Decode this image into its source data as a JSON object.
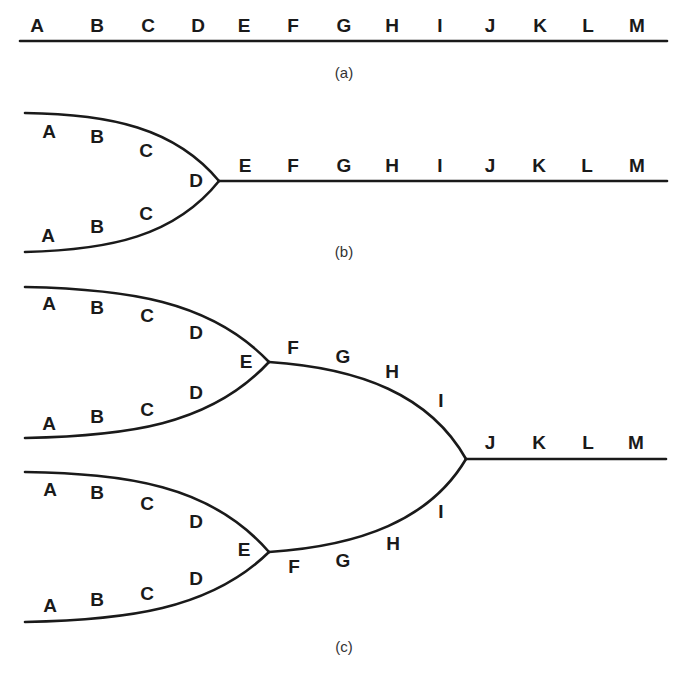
{
  "figure": {
    "panels": [
      {
        "id": "a",
        "caption": "(a)",
        "description": "Single linear sequence A through M",
        "labels": [
          "A",
          "B",
          "C",
          "D",
          "E",
          "F",
          "G",
          "H",
          "I",
          "J",
          "K",
          "L",
          "M"
        ]
      },
      {
        "id": "b",
        "caption": "(b)",
        "description": "Two branches A-B-C merging at D, continuing E through M",
        "upper_branch": [
          "A",
          "B",
          "C"
        ],
        "lower_branch": [
          "A",
          "B",
          "C"
        ],
        "junction": "D",
        "trunk": [
          "E",
          "F",
          "G",
          "H",
          "I",
          "J",
          "K",
          "L",
          "M"
        ]
      },
      {
        "id": "c",
        "caption": "(c)",
        "description": "Four branches A-D merge pairwise at E, then F-I branches merge before J, trunk J through M",
        "upper_pair": {
          "upper_branch": [
            "A",
            "B",
            "C",
            "D"
          ],
          "lower_branch": [
            "A",
            "B",
            "C",
            "D"
          ],
          "junction": "E",
          "continuation": [
            "F",
            "G",
            "H",
            "I"
          ]
        },
        "lower_pair": {
          "upper_branch": [
            "A",
            "B",
            "C",
            "D"
          ],
          "lower_branch": [
            "A",
            "B",
            "C",
            "D"
          ],
          "junction": "E",
          "continuation": [
            "F",
            "G",
            "H",
            "I"
          ]
        },
        "trunk": [
          "J",
          "K",
          "L",
          "M"
        ]
      }
    ]
  },
  "text": {
    "a": {
      "A": "A",
      "B": "B",
      "C": "C",
      "D": "D",
      "E": "E",
      "F": "F",
      "G": "G",
      "H": "H",
      "I": "I",
      "J": "J",
      "K": "K",
      "L": "L",
      "M": "M"
    },
    "cap_a": "(a)",
    "cap_b": "(b)",
    "cap_c": "(c)"
  }
}
